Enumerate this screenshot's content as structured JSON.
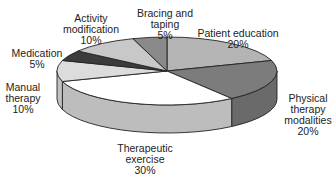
{
  "chart_data": {
    "type": "pie",
    "style": "3d",
    "title": "",
    "legend": "none",
    "slices": [
      {
        "label": "Patient education",
        "value": 20,
        "color": "#b4b4b4",
        "side": "#8e8e8e"
      },
      {
        "label": "Physical therapy modalities",
        "value": 20,
        "color": "#7c7c7c",
        "side": "#6a6a6a"
      },
      {
        "label": "Therapeutic exercise",
        "value": 30,
        "color": "#ffffff",
        "side": "#bdbdbd"
      },
      {
        "label": "Manual therapy",
        "value": 10,
        "color": "#dcdcdc",
        "side": "#c2c2c2"
      },
      {
        "label": "Medication",
        "value": 5,
        "color": "#3c3c3c",
        "side": "#2e2e2e"
      },
      {
        "label": "Activity modification",
        "value": 10,
        "color": "#c8c8c8",
        "side": "#a8a8a8"
      },
      {
        "label": "Bracing and taping",
        "value": 5,
        "color": "#8a8a8a",
        "side": "#707070"
      }
    ]
  },
  "labels": [
    {
      "lines": [
        "Bracing and",
        "taping",
        "5%"
      ],
      "x": 165,
      "y": 8
    },
    {
      "lines": [
        "Activity",
        "modification",
        "10%"
      ],
      "x": 91,
      "y": 13
    },
    {
      "lines": [
        "Patient education",
        "20%"
      ],
      "x": 238,
      "y": 28
    },
    {
      "lines": [
        "Medication",
        "5%"
      ],
      "x": 37,
      "y": 48
    },
    {
      "lines": [
        "Manual",
        "therapy",
        "10%"
      ],
      "x": 23,
      "y": 82
    },
    {
      "lines": [
        "Physical",
        "therapy",
        "modalities",
        "20%"
      ],
      "x": 308,
      "y": 93
    },
    {
      "lines": [
        "Therapeutic",
        "exercise",
        "30%"
      ],
      "x": 145,
      "y": 143
    }
  ]
}
